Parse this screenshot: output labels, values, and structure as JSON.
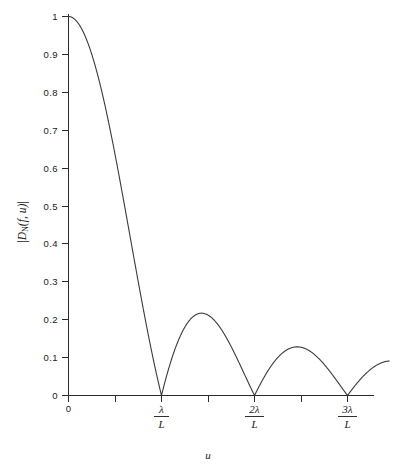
{
  "chart_data": {
    "type": "line",
    "title": "",
    "subtitle": "",
    "xlabel": "u",
    "ylabel": "|D_N(f, u)|",
    "ylabel_parts": {
      "bar_open": "|",
      "main": "D",
      "subscript": "N",
      "args": "(f, u)",
      "bar_close": "|"
    },
    "xlim": [
      0,
      3.45
    ],
    "ylim": [
      0,
      1
    ],
    "grid": false,
    "legend": null,
    "x_unit": "lambda/L",
    "x_tick_labels": [
      {
        "value": 0,
        "text": "0",
        "type": "plain"
      },
      {
        "value": 1,
        "numerator": "λ",
        "denominator": "L",
        "type": "fraction"
      },
      {
        "value": 2,
        "numerator": "2λ",
        "denominator": "L",
        "type": "fraction"
      },
      {
        "value": 3,
        "numerator": "3λ",
        "denominator": "L",
        "type": "fraction"
      }
    ],
    "x_minor_ticks": [
      0.5,
      1.5,
      2.5,
      3.5
    ],
    "y_tick_labels": [
      "0",
      "0.1",
      "0.2",
      "0.3",
      "0.4",
      "0.5",
      "0.6",
      "0.7",
      "0.8",
      "0.9",
      "1"
    ],
    "y_tick_values": [
      0,
      0.1,
      0.2,
      0.3,
      0.4,
      0.5,
      0.6,
      0.7,
      0.8,
      0.9,
      1
    ],
    "zeros": [
      1,
      2,
      3
    ],
    "sidelobe_peaks": [
      {
        "x": 1.43,
        "y": 0.217
      },
      {
        "x": 2.46,
        "y": 0.128
      },
      {
        "x": 3.47,
        "y": 0.091
      }
    ],
    "mainlobe_peak": {
      "x": 0,
      "y": 1
    },
    "curve_color": "#3a3a3a",
    "axis_color": "#2b2b2b",
    "background_color": "#ffffff",
    "series": [
      {
        "name": "|D_N(f, u)|",
        "description": "Normalized beam pattern magnitude, |sin(pi*u*L/lambda)/(pi*u*L/lambda)|",
        "x": [
          0,
          0.05,
          0.1,
          0.15,
          0.2,
          0.25,
          0.3,
          0.35,
          0.4,
          0.45,
          0.5,
          0.55,
          0.6,
          0.65,
          0.7,
          0.75,
          0.8,
          0.85,
          0.9,
          0.95,
          1.0,
          1.05,
          1.1,
          1.15,
          1.2,
          1.25,
          1.3,
          1.35,
          1.4,
          1.45,
          1.5,
          1.55,
          1.6,
          1.65,
          1.7,
          1.75,
          1.8,
          1.85,
          1.9,
          1.95,
          2.0,
          2.05,
          2.1,
          2.15,
          2.2,
          2.25,
          2.3,
          2.35,
          2.4,
          2.45,
          2.5,
          2.55,
          2.6,
          2.65,
          2.7,
          2.75,
          2.8,
          2.85,
          2.9,
          2.95,
          3.0,
          3.05,
          3.1,
          3.15,
          3.2,
          3.25,
          3.3,
          3.35,
          3.4,
          3.45
        ],
        "y": [
          1.0,
          0.9959,
          0.9836,
          0.9632,
          0.9355,
          0.9003,
          0.8584,
          0.8106,
          0.7568,
          0.6992,
          0.6366,
          0.5718,
          0.5046,
          0.4362,
          0.3679,
          0.3001,
          0.2339,
          0.172,
          0.1093,
          0.0524,
          0.0,
          0.0496,
          0.0894,
          0.1223,
          0.1557,
          0.1801,
          0.1981,
          0.209,
          0.2162,
          0.217,
          0.2122,
          0.2024,
          0.189,
          0.1704,
          0.1497,
          0.1247,
          0.1039,
          0.0786,
          0.0518,
          0.0255,
          0.0,
          0.0242,
          0.0468,
          0.0673,
          0.0852,
          0.1001,
          0.1117,
          0.1199,
          0.1244,
          0.1274,
          0.1273,
          0.1236,
          0.1168,
          0.1072,
          0.095,
          0.0809,
          0.065,
          0.0479,
          0.0302,
          0.0123,
          0.0,
          0.0158,
          0.031,
          0.0452,
          0.058,
          0.0691,
          0.0782,
          0.0851,
          0.0896,
          0.0918
        ]
      }
    ]
  },
  "figure": {
    "alt": "Plot of normalized beam pattern magnitude versus u"
  }
}
